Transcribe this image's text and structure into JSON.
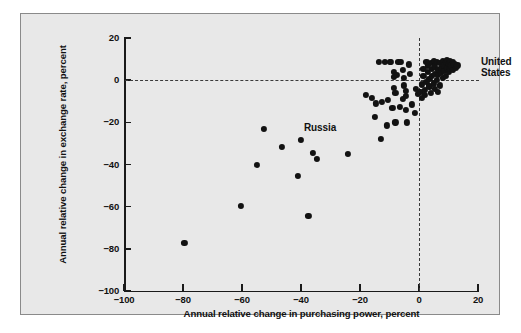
{
  "figure": {
    "background_color": "#e8e8e8",
    "point_color": "#121212",
    "axis_color": "#1a1a1a",
    "reference_line_color": "#3a3a3a"
  },
  "chart_data": {
    "type": "scatter",
    "title": "",
    "xlabel": "Annual relative change in purchasing power, percent",
    "ylabel": "Annual relative change in exchange rate, percent",
    "xlim": [
      -100,
      20
    ],
    "ylim": [
      -100,
      20
    ],
    "xticks": [
      -100,
      -80,
      -60,
      -40,
      -20,
      0,
      20
    ],
    "xticklabels": [
      "−100",
      "−80",
      "−60",
      "−40",
      "−20",
      "0",
      "20"
    ],
    "yticks": [
      20,
      0,
      -20,
      -40,
      -60,
      -80,
      -100
    ],
    "yticklabels": [
      "20",
      "0",
      "−20",
      "−40",
      "−60",
      "−80",
      "−100"
    ],
    "grid": false,
    "legend": null,
    "reference_lines": [
      {
        "orientation": "horizontal",
        "value": 0,
        "style": "dashed"
      },
      {
        "orientation": "vertical",
        "value": 0,
        "style": "dashed"
      }
    ],
    "annotations": [
      {
        "label": "Russia",
        "x": -39.0,
        "y": -22.5,
        "align": "left"
      },
      {
        "label": "United\nStates",
        "x": 21.0,
        "y": 8.5,
        "align": "left"
      }
    ],
    "points": [
      {
        "x": -79.5,
        "y": -77.0
      },
      {
        "x": -60.5,
        "y": -59.5
      },
      {
        "x": -55.0,
        "y": -40.0
      },
      {
        "x": -52.5,
        "y": -23.0
      },
      {
        "x": -46.5,
        "y": -31.5
      },
      {
        "x": -41.0,
        "y": -45.5
      },
      {
        "x": -40.0,
        "y": -28.5
      },
      {
        "x": -37.5,
        "y": -64.5
      },
      {
        "x": -36.0,
        "y": -34.5
      },
      {
        "x": -34.5,
        "y": -37.5
      },
      {
        "x": -24.0,
        "y": -35.0
      },
      {
        "x": -18.0,
        "y": -7.0
      },
      {
        "x": -16.0,
        "y": -8.5
      },
      {
        "x": -15.0,
        "y": -17.5
      },
      {
        "x": -14.5,
        "y": -11.0
      },
      {
        "x": -13.5,
        "y": 8.5
      },
      {
        "x": -13.0,
        "y": -28.0
      },
      {
        "x": -12.5,
        "y": -10.5
      },
      {
        "x": -11.5,
        "y": 8.5
      },
      {
        "x": -11.0,
        "y": -21.5
      },
      {
        "x": -10.5,
        "y": -9.5
      },
      {
        "x": -10.0,
        "y": 8.5
      },
      {
        "x": -9.5,
        "y": 8.5
      },
      {
        "x": -9.0,
        "y": -13.0
      },
      {
        "x": -8.5,
        "y": 4.0
      },
      {
        "x": -8.5,
        "y": 1.5
      },
      {
        "x": -8.5,
        "y": -3.5
      },
      {
        "x": -8.0,
        "y": -6.0
      },
      {
        "x": -8.0,
        "y": -20.0
      },
      {
        "x": -7.5,
        "y": 2.5
      },
      {
        "x": -7.0,
        "y": 8.5
      },
      {
        "x": -6.5,
        "y": -12.5
      },
      {
        "x": -6.0,
        "y": 8.5
      },
      {
        "x": -5.5,
        "y": -9.0
      },
      {
        "x": -5.5,
        "y": 5.0
      },
      {
        "x": -5.0,
        "y": 1.0
      },
      {
        "x": -5.0,
        "y": -2.5
      },
      {
        "x": -4.5,
        "y": -5.0
      },
      {
        "x": -4.5,
        "y": -7.5
      },
      {
        "x": -4.5,
        "y": -14.0
      },
      {
        "x": -4.0,
        "y": -20.0
      },
      {
        "x": -3.5,
        "y": 7.5
      },
      {
        "x": -3.0,
        "y": 3.0
      },
      {
        "x": -2.5,
        "y": -11.5
      },
      {
        "x": -1.5,
        "y": -15.5
      },
      {
        "x": -1.0,
        "y": -4.0
      },
      {
        "x": -0.5,
        "y": -6.5
      },
      {
        "x": 0.5,
        "y": -5.5
      },
      {
        "x": 1.0,
        "y": -2.0
      },
      {
        "x": 1.5,
        "y": 2.0
      },
      {
        "x": 1.5,
        "y": 5.5
      },
      {
        "x": 2.0,
        "y": -4.5
      },
      {
        "x": 2.0,
        "y": -7.0
      },
      {
        "x": 2.5,
        "y": -1.0
      },
      {
        "x": 3.0,
        "y": 7.0
      },
      {
        "x": 3.0,
        "y": 4.0
      },
      {
        "x": 3.5,
        "y": 0.5
      },
      {
        "x": 3.5,
        "y": -3.0
      },
      {
        "x": 4.0,
        "y": 8.0
      },
      {
        "x": 4.5,
        "y": 5.5
      },
      {
        "x": 4.5,
        "y": 2.0
      },
      {
        "x": 5.0,
        "y": -1.5
      },
      {
        "x": 5.0,
        "y": 9.0
      },
      {
        "x": 5.5,
        "y": 6.5
      },
      {
        "x": 5.5,
        "y": 3.0
      },
      {
        "x": 6.0,
        "y": 8.5
      },
      {
        "x": 6.0,
        "y": 0.0
      },
      {
        "x": 6.5,
        "y": 5.0
      },
      {
        "x": 6.5,
        "y": 2.5
      },
      {
        "x": 7.0,
        "y": 8.0
      },
      {
        "x": 7.0,
        "y": -2.5
      },
      {
        "x": 7.5,
        "y": 6.0
      },
      {
        "x": 7.5,
        "y": 3.5
      },
      {
        "x": 8.0,
        "y": 9.0
      },
      {
        "x": 8.0,
        "y": 1.0
      },
      {
        "x": 8.5,
        "y": 7.0
      },
      {
        "x": 8.5,
        "y": 4.5
      },
      {
        "x": 9.0,
        "y": 8.5
      },
      {
        "x": 9.0,
        "y": 2.0
      },
      {
        "x": 9.5,
        "y": 6.0
      },
      {
        "x": 9.5,
        "y": 9.5
      },
      {
        "x": 10.0,
        "y": 4.0
      },
      {
        "x": 10.0,
        "y": 7.5
      },
      {
        "x": 10.5,
        "y": 9.0
      },
      {
        "x": 10.5,
        "y": 5.5
      },
      {
        "x": 11.0,
        "y": 7.0
      },
      {
        "x": 11.5,
        "y": 8.5
      },
      {
        "x": 11.5,
        "y": 5.0
      },
      {
        "x": 12.0,
        "y": 7.5
      },
      {
        "x": 12.5,
        "y": 6.0
      },
      {
        "x": 13.0,
        "y": 7.0
      },
      {
        "x": 2.5,
        "y": 8.5
      },
      {
        "x": 4.0,
        "y": -6.0
      },
      {
        "x": 5.5,
        "y": -4.0
      },
      {
        "x": 1.0,
        "y": -8.5
      },
      {
        "x": 6.5,
        "y": -5.5
      }
    ]
  }
}
